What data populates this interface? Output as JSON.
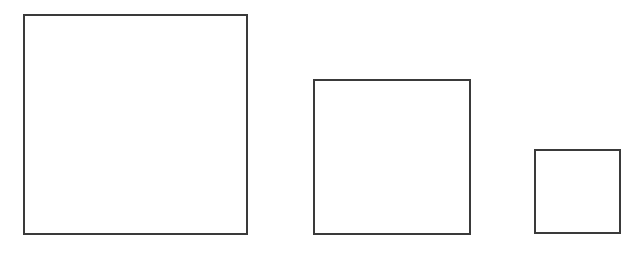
{
  "diagram": {
    "stroke_color": "#3a3a3a",
    "background_color": "#ffffff",
    "shapes": [
      {
        "name": "large-square",
        "x": 23,
        "y": 14,
        "width": 225,
        "height": 221
      },
      {
        "name": "medium-square",
        "x": 313,
        "y": 79,
        "width": 158,
        "height": 156
      },
      {
        "name": "small-square",
        "x": 534,
        "y": 149,
        "width": 87,
        "height": 85
      }
    ]
  }
}
